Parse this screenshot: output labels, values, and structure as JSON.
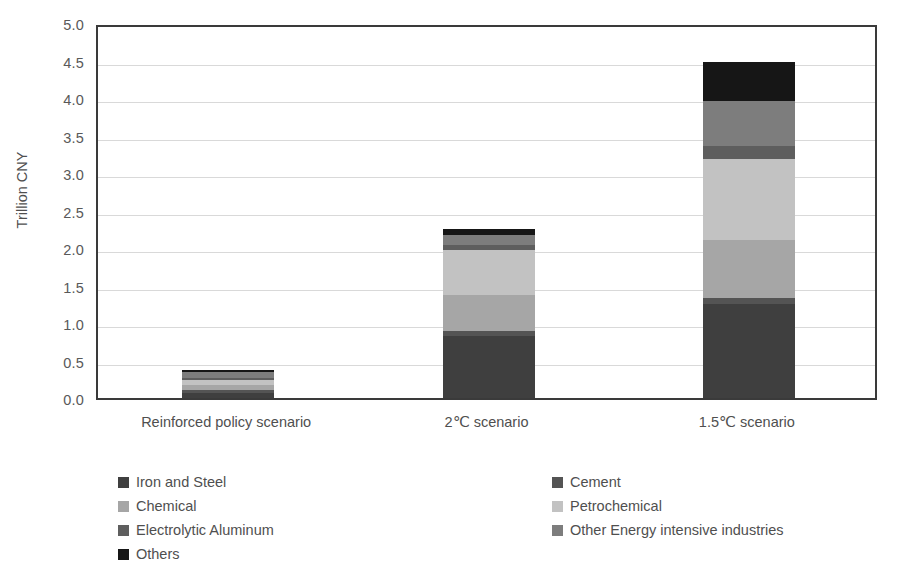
{
  "chart_data": {
    "type": "bar",
    "subtype": "stacked-bar",
    "title": "",
    "xlabel": "",
    "ylabel": "Trillion CNY",
    "ylim": [
      0.0,
      5.0
    ],
    "ytick_step": 0.5,
    "grid": true,
    "legend_position": "bottom",
    "legend_columns": 2,
    "categories": [
      "Reinforced policy scenario",
      "2℃ scenario",
      "1.5℃ scenario"
    ],
    "ytick_labels": [
      "0.0",
      "0.5",
      "1.0",
      "1.5",
      "2.0",
      "2.5",
      "3.0",
      "3.5",
      "4.0",
      "4.5",
      "5.0"
    ],
    "ytick_values": [
      0.0,
      0.5,
      1.0,
      1.5,
      2.0,
      2.5,
      3.0,
      3.5,
      4.0,
      4.5,
      5.0
    ],
    "series": [
      {
        "name": "Iron and Steel",
        "color": "#3f3f3f",
        "values": [
          0.07,
          0.83,
          1.25
        ]
      },
      {
        "name": "Cement",
        "color": "#545454",
        "values": [
          0.04,
          0.07,
          0.08
        ]
      },
      {
        "name": "Chemical",
        "color": "#a6a6a6",
        "values": [
          0.06,
          0.48,
          0.78
        ]
      },
      {
        "name": "Petrochemical",
        "color": "#c2c2c2",
        "values": [
          0.07,
          0.6,
          1.08
        ]
      },
      {
        "name": "Electrolytic Aluminum",
        "color": "#5e5e5e",
        "values": [
          0.03,
          0.06,
          0.17
        ]
      },
      {
        "name": "Other Energy intensive industries",
        "color": "#7d7d7d",
        "values": [
          0.08,
          0.14,
          0.6
        ]
      },
      {
        "name": "Others",
        "color": "#161616",
        "values": [
          0.03,
          0.07,
          0.52
        ]
      }
    ],
    "totals": [
      0.38,
      2.25,
      4.48
    ]
  },
  "axis": {
    "y_title": "Trillion CNY"
  },
  "legend": {
    "left_column": [
      {
        "label": "Iron and Steel",
        "color": "#3f3f3f"
      },
      {
        "label": "Chemical",
        "color": "#a6a6a6"
      },
      {
        "label": "Electrolytic Aluminum",
        "color": "#5e5e5e"
      },
      {
        "label": "Others",
        "color": "#161616"
      }
    ],
    "right_column": [
      {
        "label": "Cement",
        "color": "#545454"
      },
      {
        "label": "Petrochemical",
        "color": "#c2c2c2"
      },
      {
        "label": "Other Energy intensive industries",
        "color": "#7d7d7d"
      }
    ]
  }
}
